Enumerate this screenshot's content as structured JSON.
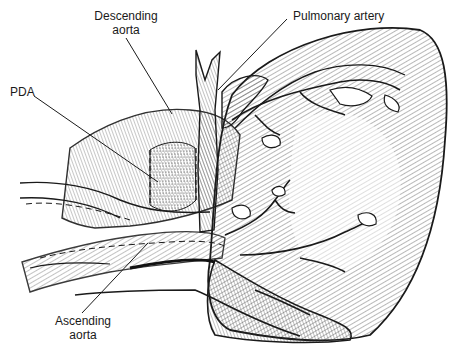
{
  "figure": {
    "labels": {
      "descending_aorta": {
        "line1": "Descending",
        "line2": "aorta"
      },
      "pulmonary_artery": {
        "text": "Pulmonary artery"
      },
      "pda": {
        "text": "PDA"
      },
      "ascending_aorta": {
        "line1": "Ascending",
        "line2": "aorta"
      }
    },
    "colors": {
      "ink": "#1a1a1a",
      "background": "#ffffff",
      "stipple": "#555555"
    }
  }
}
